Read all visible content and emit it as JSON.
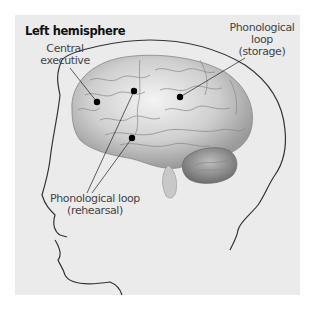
{
  "diagram": {
    "title": "Left hemisphere",
    "labels": {
      "central_executive": [
        "Central",
        "executive"
      ],
      "phonological_storage": [
        "Phonological",
        "loop",
        "(storage)"
      ],
      "phonological_rehearsal": [
        "Phonological loop",
        "(rehearsal)"
      ]
    },
    "markers": [
      {
        "name": "central-executive",
        "x": 97,
        "y": 102
      },
      {
        "name": "phonological-rehearsal-upper",
        "x": 134,
        "y": 91
      },
      {
        "name": "phonological-storage",
        "x": 180,
        "y": 97
      },
      {
        "name": "phonological-rehearsal-lower",
        "x": 132,
        "y": 138
      }
    ],
    "colors": {
      "background": "#ebebeb",
      "outline": "#333333",
      "marker": "#000000",
      "text": "#444444",
      "title": "#111111"
    }
  }
}
